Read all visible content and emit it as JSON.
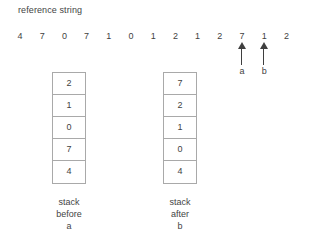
{
  "figure": {
    "title": "reference string",
    "reference_string": {
      "values": [
        "4",
        "7",
        "0",
        "7",
        "1",
        "0",
        "1",
        "2",
        "1",
        "2",
        "7",
        "1",
        "2"
      ],
      "start_x": 20,
      "spacing": 22.2
    },
    "pointers": [
      {
        "label": "a",
        "index": 10,
        "points_to_value": "2"
      },
      {
        "label": "b",
        "index": 11,
        "points_to_value": "7"
      }
    ],
    "stacks": [
      {
        "id": "stack-before-a",
        "cells": [
          "2",
          "1",
          "0",
          "7",
          "4"
        ],
        "caption_lines": [
          "stack",
          "before",
          "a"
        ]
      },
      {
        "id": "stack-after-b",
        "cells": [
          "7",
          "2",
          "1",
          "0",
          "4"
        ],
        "caption_lines": [
          "stack",
          "after",
          "b"
        ]
      }
    ],
    "colors": {
      "background": "#ffffff",
      "text": "#3f3f3f",
      "border": "#a9a9a9",
      "arrow": "#3f3f3f"
    }
  }
}
